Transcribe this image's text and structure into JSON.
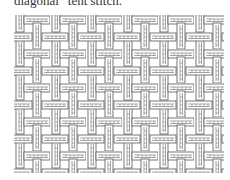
{
  "caption": "diagonal” tent stitch.",
  "figure": {
    "type": "basketweave-stitch-diagram",
    "line_color": "#555555",
    "background": "#ffffff"
  }
}
